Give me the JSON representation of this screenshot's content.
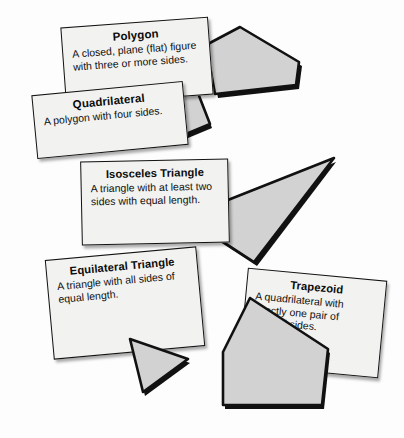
{
  "page": {
    "background_color": "#ffffff",
    "card_fill_color": "#f2f2f0",
    "card_border_color": "#121212",
    "shape_fill_color": "#d0d0d0",
    "shape_edge_color": "#111111"
  },
  "cards": [
    {
      "id": "polygon",
      "title": "Polygon",
      "body": "A closed, plane (flat) figure with three or more sides.",
      "rotation_deg": -4.2
    },
    {
      "id": "quadrilateral",
      "title": "Quadrilateral",
      "body": "A polygon with four sides.",
      "rotation_deg": -5.4
    },
    {
      "id": "isosceles",
      "title": "Isosceles Triangle",
      "body": "A triangle with at least two sides with equal length.",
      "rotation_deg": -1.2
    },
    {
      "id": "equilateral",
      "title": "Equilateral Triangle",
      "body": "A triangle with all sides of equal length.",
      "rotation_deg": -5.2
    },
    {
      "id": "trapezoid",
      "title": "Trapezoid",
      "body": "A quadrilateral with exactly one pair of parallel sides.",
      "rotation_deg": 5.4
    }
  ],
  "shapes": [
    {
      "id": "polygon-shape",
      "name": "pentagon-shape",
      "sides": 5
    },
    {
      "id": "quadrilateral-shape",
      "name": "quadrilateral-shape",
      "sides": 4
    },
    {
      "id": "isosceles-shape",
      "name": "isosceles-triangle-shape",
      "sides": 3
    },
    {
      "id": "equilateral-shape",
      "name": "equilateral-triangle-shape",
      "sides": 3
    },
    {
      "id": "trapezoid-shape",
      "name": "trapezoid-shape",
      "sides": 4
    }
  ]
}
